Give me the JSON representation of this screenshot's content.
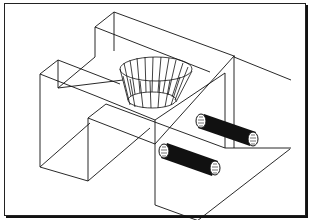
{
  "figure": {
    "stroke_color": "#111111",
    "background": "#ffffff",
    "frame_border": "#222222",
    "bore_fill": "#111111"
  },
  "parts": {
    "left_block": "left-step-block",
    "cone": "tapered-conical-pocket",
    "right_block": "right-tall-block",
    "bores": [
      "upper-bore",
      "lower-bore"
    ]
  }
}
